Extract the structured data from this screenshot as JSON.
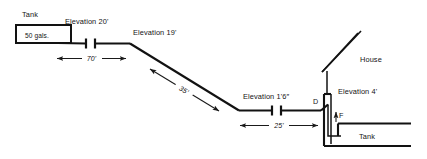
{
  "diagram": {
    "background_color": "#ffffff",
    "line_color": "#121212",
    "text_color": "#141414"
  },
  "labels": {
    "tank_top_title": "Tank",
    "tank_top_capacity": "50 gals.",
    "elevation_20": "Elevation 20'",
    "elevation_19": "Elevation 19'",
    "elevation_1_6": "Elevation 1'6″",
    "elevation_4": "Elevation 4'",
    "house": "House",
    "tank_bottom_title": "Tank",
    "point_d": "D",
    "point_f": "F"
  },
  "dimensions": [
    {
      "id": "run-70",
      "value": "70'",
      "orientation": "horizontal"
    },
    {
      "id": "slope-35",
      "value": "35'",
      "orientation": "diagonal"
    },
    {
      "id": "run-25",
      "value": "25'",
      "orientation": "horizontal"
    }
  ],
  "elevations": [
    {
      "id": "elev-20",
      "value": "20'",
      "label": "Elevation 20'"
    },
    {
      "id": "elev-19",
      "value": "19'",
      "label": "Elevation 19'"
    },
    {
      "id": "elev-1-6",
      "value": "1'6″",
      "label": "Elevation 1'6″"
    },
    {
      "id": "elev-4",
      "value": "4'",
      "label": "Elevation 4'"
    }
  ],
  "components": [
    {
      "id": "supply-tank",
      "name": "Tank",
      "capacity": "50 gals."
    },
    {
      "id": "union-fitting-upper",
      "name": "union-fitting"
    },
    {
      "id": "union-fitting-lower",
      "name": "union-fitting"
    },
    {
      "id": "house",
      "name": "House"
    },
    {
      "id": "receiving-tank",
      "name": "Tank"
    },
    {
      "id": "point-d",
      "name": "D"
    },
    {
      "id": "point-f",
      "name": "F"
    }
  ]
}
